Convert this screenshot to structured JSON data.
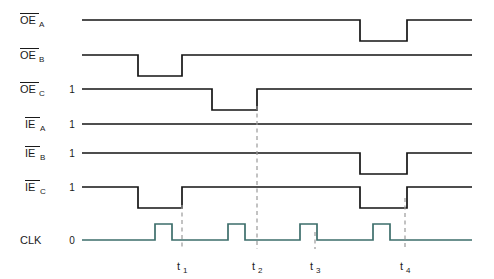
{
  "figure": {
    "kind": "digital-timing-diagram",
    "width": 494,
    "height": 279,
    "background": "#ffffff",
    "colors": {
      "signal": "#141414",
      "clock": "#3d6e6b",
      "marker": "#9a9a9a",
      "text": "#1a1a1a"
    }
  },
  "signals": [
    {
      "id": "oe-a",
      "base": "OE",
      "subscript": "A",
      "overline": true,
      "level_label": "",
      "baseline_y": 20,
      "high_y": 20,
      "low_y": 41,
      "track": "black",
      "edges": [
        {
          "x": 360,
          "to": "low"
        },
        {
          "x": 407,
          "to": "high"
        }
      ]
    },
    {
      "id": "oe-b",
      "base": "OE",
      "subscript": "B",
      "overline": true,
      "level_label": "",
      "baseline_y": 55,
      "high_y": 55,
      "low_y": 76,
      "track": "black",
      "edges": [
        {
          "x": 138,
          "to": "low"
        },
        {
          "x": 182,
          "to": "high"
        }
      ]
    },
    {
      "id": "oe-c",
      "base": "OE",
      "subscript": "C",
      "overline": true,
      "level_label": "1",
      "baseline_y": 89,
      "high_y": 89,
      "low_y": 110,
      "track": "black",
      "edges": [
        {
          "x": 212,
          "to": "low"
        },
        {
          "x": 257,
          "to": "high"
        }
      ]
    },
    {
      "id": "ie-a",
      "base": "IE",
      "subscript": "A",
      "overline": true,
      "level_label": "1",
      "baseline_y": 124,
      "high_y": 124,
      "low_y": 145,
      "track": "black",
      "edges": []
    },
    {
      "id": "ie-b",
      "base": "IE",
      "subscript": "B",
      "overline": true,
      "level_label": "1",
      "baseline_y": 153,
      "high_y": 153,
      "low_y": 174,
      "track": "black",
      "edges": [
        {
          "x": 360,
          "to": "low"
        },
        {
          "x": 407,
          "to": "high"
        }
      ]
    },
    {
      "id": "ie-c",
      "base": "IE",
      "subscript": "C",
      "overline": true,
      "level_label": "1",
      "baseline_y": 187,
      "high_y": 187,
      "low_y": 208,
      "track": "black",
      "edges": [
        {
          "x": 138,
          "to": "low"
        },
        {
          "x": 182,
          "to": "high"
        },
        {
          "x": 360,
          "to": "low"
        },
        {
          "x": 407,
          "to": "high"
        }
      ]
    },
    {
      "id": "clk",
      "base": "CLK",
      "subscript": "",
      "overline": false,
      "level_label": "0",
      "baseline_y": 240,
      "high_y": 224,
      "low_y": 240,
      "track": "clock",
      "pulses": [
        {
          "rise": 155,
          "fall": 172
        },
        {
          "rise": 228,
          "fall": 245
        },
        {
          "rise": 300,
          "fall": 317
        },
        {
          "rise": 373,
          "fall": 390
        }
      ]
    }
  ],
  "wave_span": {
    "x_start": 82,
    "x_end": 472
  },
  "time_markers": [
    {
      "label": "t",
      "subscript": "1",
      "x": 182,
      "y_top": 205,
      "y_bottom": 249
    },
    {
      "label": "t",
      "subscript": "2",
      "x": 257,
      "y_top": 106,
      "y_bottom": 249
    },
    {
      "label": "t",
      "subscript": "3",
      "x": 315,
      "y_top": 232,
      "y_bottom": 249
    },
    {
      "label": "t",
      "subscript": "4",
      "x": 405,
      "y_top": 198,
      "y_bottom": 249
    }
  ],
  "label_column": {
    "label_right_x": 63,
    "level_x": 72
  }
}
